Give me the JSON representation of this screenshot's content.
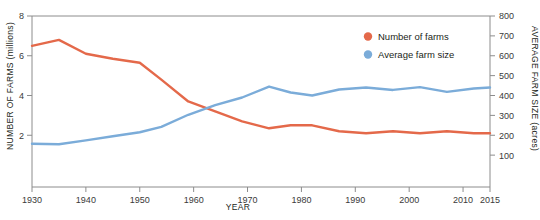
{
  "chart_data": {
    "type": "line",
    "title": "",
    "subtitle": "",
    "xlabel": "YEAR",
    "ylabel": "NUMBER OF FARMS (millions)",
    "y2label": "AVERAGE FARM SIZE (acres)",
    "grid": false,
    "legend_position": "top-right",
    "xlim": [
      1930,
      2015
    ],
    "ylim": [
      0,
      8
    ],
    "y2lim": [
      0,
      800
    ],
    "xticks": [
      1930,
      1940,
      1950,
      1960,
      1970,
      1980,
      1990,
      2000,
      2010,
      2015
    ],
    "xticklabels": [
      "1930",
      "1940",
      "1950",
      "1960",
      "1970",
      "1980",
      "1990",
      "2000",
      "2010",
      "2015"
    ],
    "yticks": [
      2,
      4,
      6,
      8
    ],
    "yticklabels": [
      "2",
      "4",
      "6",
      "8"
    ],
    "y2ticks": [
      100,
      200,
      300,
      400,
      500,
      600,
      700,
      800
    ],
    "y2ticklabels": [
      "100",
      "200",
      "300",
      "400",
      "500",
      "600",
      "700",
      "800"
    ],
    "x": [
      1930,
      1935,
      1940,
      1945,
      1950,
      1954,
      1959,
      1964,
      1969,
      1974,
      1978,
      1982,
      1987,
      1992,
      1997,
      2002,
      2007,
      2012,
      2015
    ],
    "series": [
      {
        "name": "Number of farms",
        "axis": "left",
        "units": "millions",
        "color": "#e4694a",
        "values": [
          6.5,
          6.8,
          6.1,
          5.85,
          5.65,
          4.8,
          3.7,
          3.2,
          2.7,
          2.35,
          2.5,
          2.5,
          2.2,
          2.1,
          2.2,
          2.1,
          2.2,
          2.1,
          2.1
        ]
      },
      {
        "name": "Average farm size",
        "axis": "right",
        "units": "acres",
        "color": "#7bacd9",
        "values": [
          157,
          155,
          174,
          195,
          215,
          242,
          303,
          352,
          390,
          445,
          415,
          400,
          430,
          440,
          428,
          442,
          418,
          435,
          440
        ]
      }
    ]
  },
  "legend": {
    "items": [
      {
        "label": "Number of farms",
        "color": "#e4694a"
      },
      {
        "label": "Average farm size",
        "color": "#7bacd9"
      }
    ]
  },
  "axes": {
    "left_title": "NUMBER OF FARMS (millions)",
    "right_title": "AVERAGE FARM SIZE (acres)",
    "bottom_title": "YEAR"
  },
  "colors": {
    "series_orange": "#e4694a",
    "series_blue": "#7bacd9",
    "axis": "#8c8c8c",
    "text": "#231f20",
    "background": "#ffffff"
  }
}
